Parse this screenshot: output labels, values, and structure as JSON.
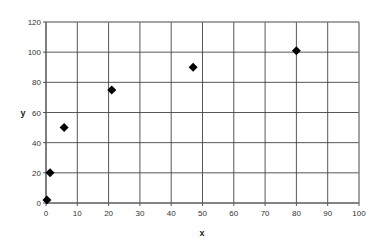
{
  "chart_data": {
    "type": "scatter",
    "title": "",
    "xlabel": "x",
    "ylabel": "y",
    "xlim": [
      0,
      100
    ],
    "ylim": [
      0,
      120
    ],
    "xticks": [
      0,
      10,
      20,
      30,
      40,
      50,
      60,
      70,
      80,
      90,
      100
    ],
    "yticks": [
      0,
      20,
      40,
      60,
      80,
      100,
      120
    ],
    "grid": true,
    "legend": null,
    "marker": "diamond",
    "series": [
      {
        "name": "",
        "color": "#000000",
        "points": [
          {
            "x": 0.3,
            "y": 2
          },
          {
            "x": 1.3,
            "y": 20
          },
          {
            "x": 5.8,
            "y": 50
          },
          {
            "x": 21,
            "y": 75
          },
          {
            "x": 47,
            "y": 90
          },
          {
            "x": 80,
            "y": 101
          }
        ]
      }
    ]
  },
  "colors": {
    "grid": "#444444",
    "frame": "#999999",
    "marker": "#000000"
  }
}
